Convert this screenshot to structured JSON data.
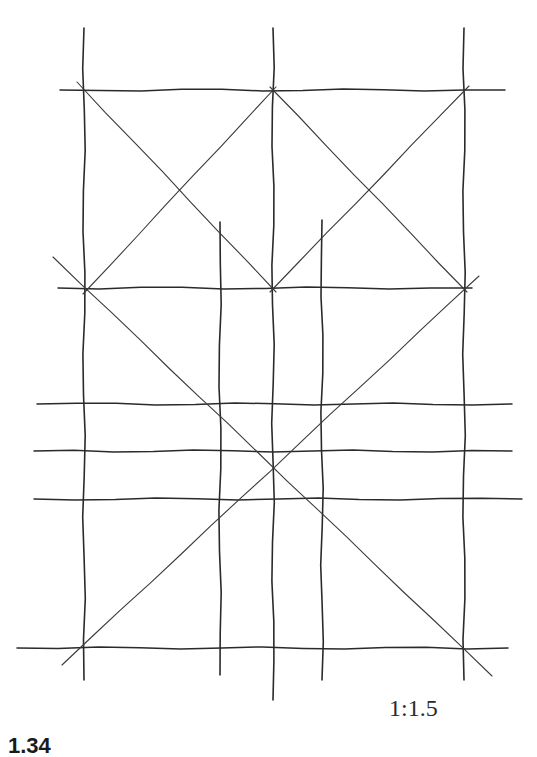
{
  "diagram": {
    "type": "hand-drawn proportion grid construction",
    "ratio_label": "1:1.5",
    "figure_label": "1.34",
    "stroke_color": "#2a2a2a",
    "vertical_lines": [
      {
        "x": 84,
        "y1": 28,
        "y2": 680
      },
      {
        "x": 220,
        "y1": 222,
        "y2": 675
      },
      {
        "x": 273,
        "y1": 28,
        "y2": 700
      },
      {
        "x": 322,
        "y1": 220,
        "y2": 680
      },
      {
        "x": 464,
        "y1": 28,
        "y2": 680
      }
    ],
    "horizontal_lines": [
      {
        "y": 90,
        "x1": 60,
        "x2": 505
      },
      {
        "y": 288,
        "x1": 58,
        "x2": 472
      },
      {
        "y": 404,
        "x1": 37,
        "x2": 512
      },
      {
        "y": 451,
        "x1": 34,
        "x2": 512
      },
      {
        "y": 499,
        "x1": 34,
        "x2": 522
      },
      {
        "y": 648,
        "x1": 17,
        "x2": 508
      }
    ],
    "diagonal_lines": [
      {
        "x1": 77,
        "y1": 82,
        "x2": 276,
        "y2": 292
      },
      {
        "x1": 276,
        "y1": 87,
        "x2": 83,
        "y2": 294
      },
      {
        "x1": 270,
        "y1": 87,
        "x2": 467,
        "y2": 292
      },
      {
        "x1": 469,
        "y1": 86,
        "x2": 270,
        "y2": 292
      },
      {
        "x1": 53,
        "y1": 257,
        "x2": 492,
        "y2": 676
      },
      {
        "x1": 62,
        "y1": 665,
        "x2": 479,
        "y2": 276
      }
    ]
  }
}
